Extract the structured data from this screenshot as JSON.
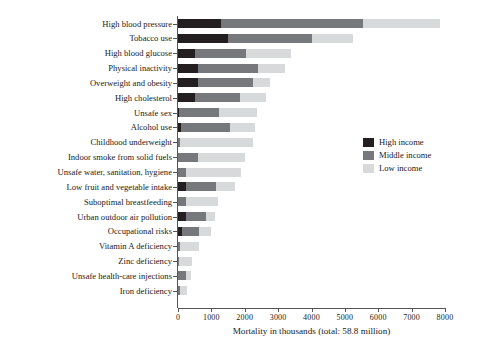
{
  "chart_data": {
    "type": "bar",
    "orientation": "horizontal",
    "stacked": true,
    "title": "",
    "xlabel": "Mortality in thousands (total: 58.8 million)",
    "ylabel": "",
    "xlim": [
      0,
      8000
    ],
    "xticks": [
      0,
      1000,
      2000,
      3000,
      4000,
      5000,
      6000,
      7000,
      8000
    ],
    "grid": false,
    "legend_position": "right-middle",
    "categories": [
      "High blood pressure",
      "Tobacco use",
      "High blood glucose",
      "Physical inactivity",
      "Overweight and obesity",
      "High cholesterol",
      "Unsafe sex",
      "Alcohol use",
      "Childhood underweight",
      "Indoor smoke from solid fuels",
      "Unsafe water, sanitation, hygiene",
      "Low fruit and vegetable intake",
      "Suboptimal breastfeeding",
      "Urban outdoor air pollution",
      "Occupational risks",
      "Vitamin A deficiency",
      "Zinc deficiency",
      "Unsafe health-care injections",
      "Iron deficiency"
    ],
    "series": [
      {
        "name": "High income",
        "color": "#231f20",
        "values": [
          1300,
          1500,
          500,
          600,
          600,
          500,
          20,
          100,
          0,
          0,
          0,
          250,
          0,
          230,
          120,
          0,
          0,
          0,
          0
        ]
      },
      {
        "name": "Middle income",
        "color": "#77787b",
        "values": [
          4250,
          2500,
          1550,
          1800,
          1650,
          1350,
          1200,
          1450,
          60,
          600,
          250,
          900,
          250,
          620,
          510,
          70,
          40,
          230,
          60
        ]
      },
      {
        "name": "Low income",
        "color": "#d8d9da",
        "values": [
          2300,
          1250,
          1350,
          800,
          500,
          800,
          1150,
          750,
          2200,
          1400,
          1650,
          550,
          950,
          250,
          350,
          560,
          390,
          170,
          200
        ]
      }
    ],
    "totals": [
      7850,
      5250,
      3400,
      3200,
      2750,
      2650,
      2370,
      2300,
      2260,
      2000,
      1900,
      1700,
      1200,
      1100,
      980,
      630,
      430,
      400,
      260
    ]
  },
  "legend": {
    "items": [
      {
        "label": "High income",
        "color": "#231f20"
      },
      {
        "label": "Middle income",
        "color": "#77787b"
      },
      {
        "label": "Low income",
        "color": "#d8d9da"
      }
    ]
  }
}
